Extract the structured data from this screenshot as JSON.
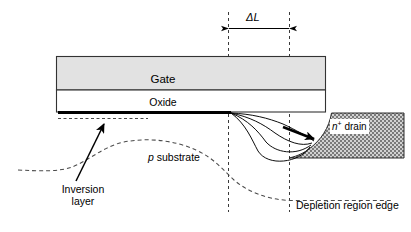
{
  "figure": {
    "labels": {
      "gate": "Gate",
      "oxide": "Oxide",
      "delta_l": "ΔL",
      "drain_n": "n",
      "drain_sup": "+",
      "drain_word": " drain",
      "p_substrate_italic": "p",
      "p_substrate_word": " substrate",
      "inversion_line1": "Inversion",
      "inversion_line2": "layer",
      "depletion": "Depletion region edge"
    },
    "colors": {
      "line": "#000000",
      "gate_fill": "#e2e2e2",
      "oxide_fill": "#ffffff",
      "drain_fill": "#cccccc",
      "drain_stipple": "#6f6f6f",
      "dashed": "#555555",
      "background": "#ffffff"
    },
    "geometry": {
      "gate_rect": {
        "x": 56,
        "y": 56,
        "w": 270,
        "h": 34
      },
      "oxide_rect": {
        "x": 56,
        "y": 90,
        "w": 270,
        "h": 22
      },
      "inversion_bar": {
        "x1": 58,
        "y": 112,
        "x2": 232
      },
      "dashed_vertical_left_x": 228,
      "dashed_vertical_right_x": 289,
      "dashed_vertical_y_top": 12,
      "dashed_vertical_y_bottom": 212,
      "delta_l_arrow_y": 28,
      "drain_region": {
        "x": 289,
        "y": 113,
        "w": 115,
        "h": 45
      },
      "field_line_count": 4
    }
  }
}
